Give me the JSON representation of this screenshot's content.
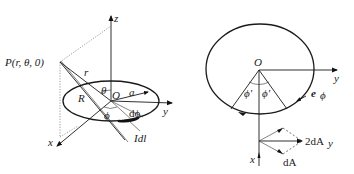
{
  "left_diagram": {
    "labels": {
      "point": "P(r, θ, 0)",
      "z_axis": "z",
      "y_axis": "y",
      "x_axis": "x",
      "r": "r",
      "R": "R",
      "theta": "θ",
      "origin": "O",
      "radius": "a",
      "dphi": "dϕ",
      "phi": "ϕ",
      "current_element": "Idl"
    }
  },
  "right_diagram": {
    "labels": {
      "origin": "O",
      "y_axis": "y",
      "x_axis": "x",
      "phi_left": "ϕ'",
      "phi_right": "ϕ'",
      "unit_vector": "e",
      "unit_vector_sub": "ϕ",
      "sum_vector": "2dA",
      "sum_vector_sub": "y",
      "dA": "dA"
    }
  }
}
